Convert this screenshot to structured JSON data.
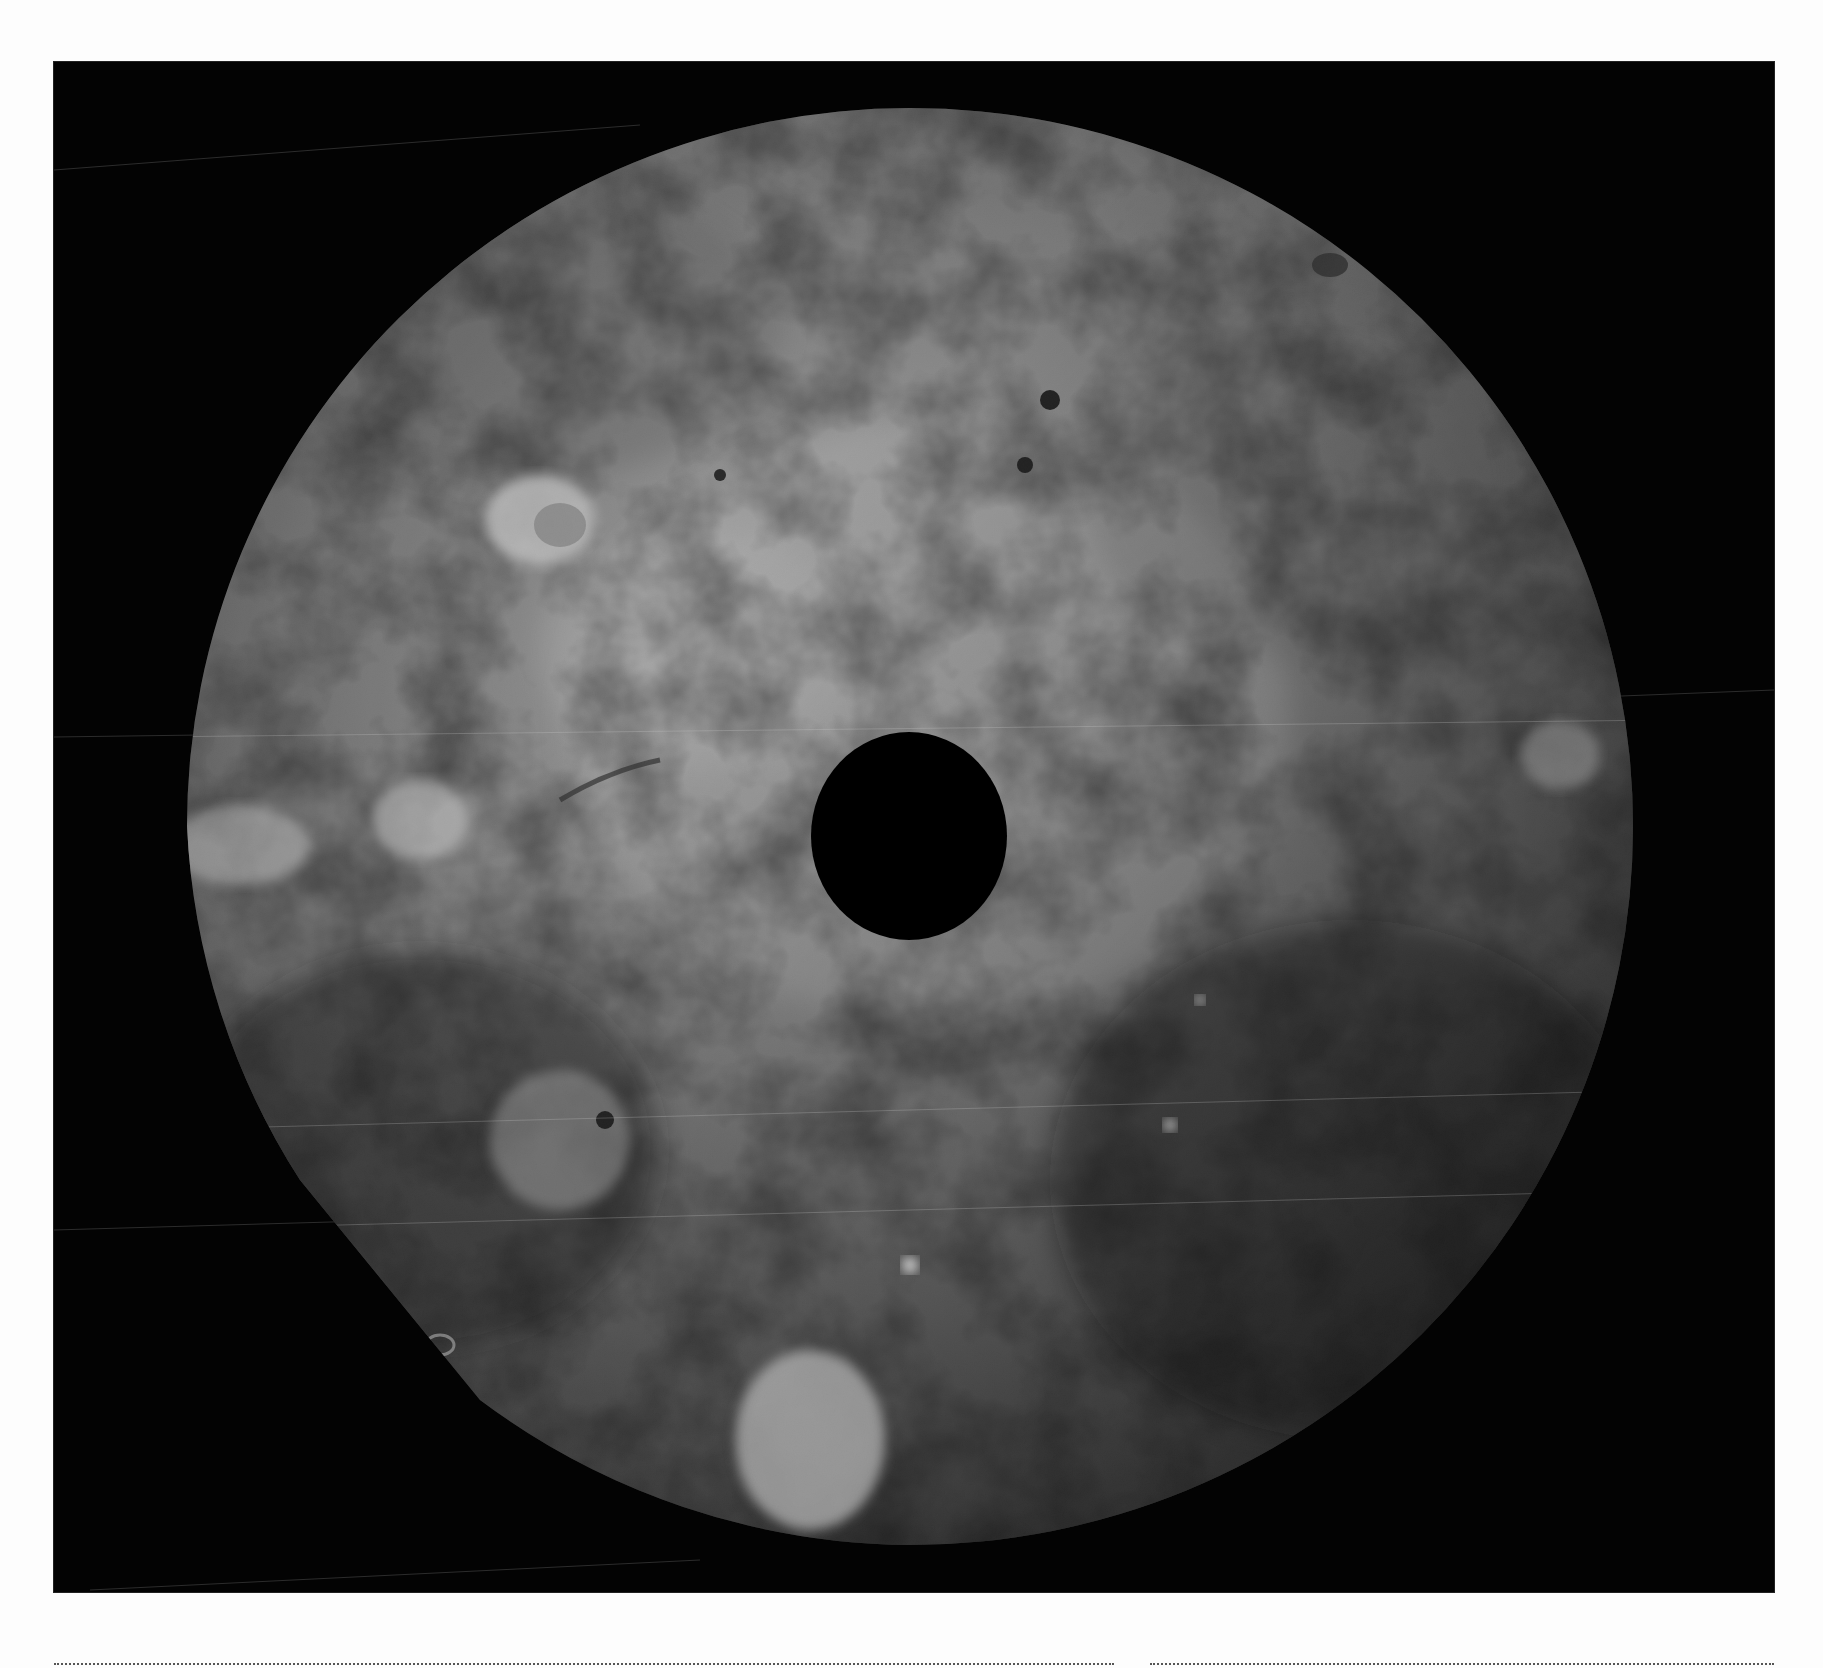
{
  "figure": {
    "background_color": "#030303",
    "page_color": "#fdfdfd",
    "disc": {
      "center_x": 910,
      "center_y": 826,
      "radius_x": 723,
      "radius_y": 718,
      "tone_light": "#a9a9a9",
      "tone_mid": "#7a7a7a",
      "tone_dark": "#1c1c1c"
    },
    "polar_gap": {
      "center_x": 909,
      "center_y": 836,
      "radius_x": 98,
      "radius_y": 104,
      "color": "#000000"
    },
    "features": [
      {
        "name": "bright-crater-northwest",
        "x": 540,
        "y": 520,
        "r": 45
      },
      {
        "name": "bright-patch-south",
        "x": 810,
        "y": 1440,
        "r": 80
      },
      {
        "name": "bright-spot-west",
        "x": 420,
        "y": 820,
        "r": 35
      },
      {
        "name": "dark-spot-north",
        "x": 1050,
        "y": 400,
        "r": 14
      },
      {
        "name": "bright-spot-southeast",
        "x": 1170,
        "y": 1125,
        "r": 10
      },
      {
        "name": "bright-spot-south-center",
        "x": 910,
        "y": 1265,
        "r": 12
      }
    ]
  },
  "rules": {
    "style": "dotted",
    "segments": 2
  }
}
